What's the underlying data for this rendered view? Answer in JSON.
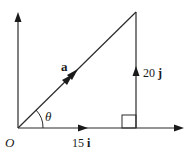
{
  "diagram": {
    "type": "vector-triangle",
    "colors": {
      "line": "#2a2a2a",
      "text": "#1a1a1a",
      "background": "#ffffff"
    },
    "labels": {
      "origin": "O",
      "vector_a": "a",
      "angle": "θ",
      "horizontal_component_num": "15",
      "horizontal_component_unit": "i",
      "vertical_component_num": "20",
      "vertical_component_unit": "j"
    },
    "components": {
      "i": 15,
      "j": 20
    },
    "right_angle_marker": true
  }
}
